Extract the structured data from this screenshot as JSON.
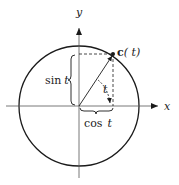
{
  "diagram": {
    "labels": {
      "x_axis": "x",
      "y_axis": "y",
      "point_name": "c",
      "point_arg": "( t)",
      "sin": "sin",
      "sin_var": "t",
      "cos": "cos",
      "cos_var": "t",
      "angle": "t"
    },
    "colors": {
      "stroke": "#1a1a1a",
      "background": "#ffffff"
    },
    "geometry": {
      "origin": [
        79,
        106
      ],
      "radius": 60,
      "point": [
        113,
        54
      ]
    }
  }
}
